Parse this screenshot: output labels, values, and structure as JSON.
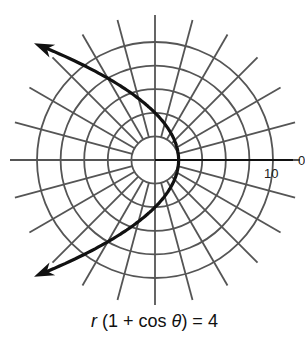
{
  "chart_data": {
    "type": "line",
    "coordinate_system": "polar",
    "title": "r (1 + cos θ) = 4",
    "equation": {
      "var_r": "r",
      "open": " (1 + cos ",
      "var_theta": "θ",
      "close": ") = 4"
    },
    "curve": {
      "name": "parabola",
      "formula": "r = 4 / (1 + cos θ)",
      "cartesian": "x = 2 - y^2/8",
      "vertex": {
        "r": 2,
        "theta_deg": 0
      },
      "theta_range_deg": [
        -136,
        136
      ],
      "arrows_on_both_ends": true,
      "color": "#111111"
    },
    "grid": {
      "rings": [
        2,
        4,
        6,
        8,
        10
      ],
      "spoke_step_deg": 15,
      "spoke_count": 24,
      "color": "#555555"
    },
    "axis_labels": {
      "radial_tick": "10",
      "polar_axis_label": "0"
    },
    "rlim": [
      0,
      10
    ]
  }
}
